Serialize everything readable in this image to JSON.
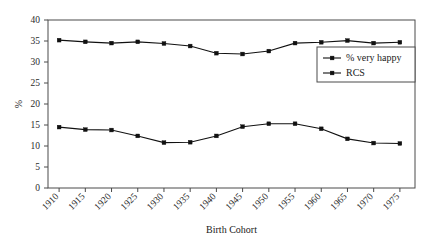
{
  "chart_data": {
    "type": "line",
    "title": "",
    "xlabel": "Birth Cohort",
    "ylabel": "%",
    "categories": [
      "1910",
      "1915",
      "1920",
      "1925",
      "1930",
      "1935",
      "1940",
      "1945",
      "1950",
      "1955",
      "1960",
      "1965",
      "1970",
      "1975"
    ],
    "x": [
      1910,
      1915,
      1920,
      1925,
      1930,
      1935,
      1940,
      1945,
      1950,
      1955,
      1960,
      1965,
      1970,
      1975
    ],
    "ylim": [
      0,
      40
    ],
    "yticks": [
      0,
      5,
      10,
      15,
      20,
      25,
      30,
      35,
      40
    ],
    "ytick_labels": [
      "0",
      "5",
      "10",
      "15",
      "20",
      "25",
      "30",
      "35",
      "40"
    ],
    "grid": false,
    "legend_position": "upper right",
    "series": [
      {
        "name": "% very happy",
        "values": [
          35.2,
          34.8,
          34.5,
          34.8,
          34.4,
          33.8,
          32.1,
          31.9,
          32.6,
          34.5,
          34.7,
          35.1,
          34.5,
          34.7
        ]
      },
      {
        "name": "RCS",
        "values": [
          14.5,
          13.9,
          13.8,
          12.4,
          10.8,
          10.9,
          12.4,
          14.6,
          15.3,
          15.3,
          14.1,
          11.7,
          10.7,
          10.6
        ]
      }
    ]
  },
  "legend": {
    "entries": [
      {
        "label": "% very happy"
      },
      {
        "label": "RCS"
      }
    ]
  },
  "axes": {
    "x_title": "Birth Cohort",
    "y_title": "%"
  }
}
